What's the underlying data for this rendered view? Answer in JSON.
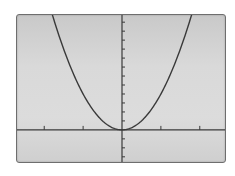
{
  "chart_data": {
    "type": "line",
    "title": "",
    "xlabel": "",
    "ylabel": "",
    "function": "y = 4x^2",
    "series": [
      {
        "name": "y = 4x^2",
        "x": [
          -1.8,
          -1.5,
          -1.0,
          -0.5,
          0,
          0.5,
          1.0,
          1.5,
          1.75
        ],
        "values": [
          12.96,
          9,
          4,
          1,
          0,
          1,
          4,
          9,
          12.25
        ]
      }
    ],
    "xlim": [
      -2.7,
      2.7
    ],
    "ylim": [
      -3.8,
      12.8
    ],
    "x_ticks": [
      -2,
      -1,
      1,
      2
    ],
    "x_tick_step": 1,
    "y_tick_step": 1,
    "y_ticks_above": 12,
    "y_ticks_below": 3,
    "grid": false,
    "legend": "none",
    "colors": {
      "curve": "#3a3a3a",
      "axes": "#3a3a3a",
      "screen_bg": "#d8d8d8",
      "border": "#6e6e6e"
    }
  }
}
